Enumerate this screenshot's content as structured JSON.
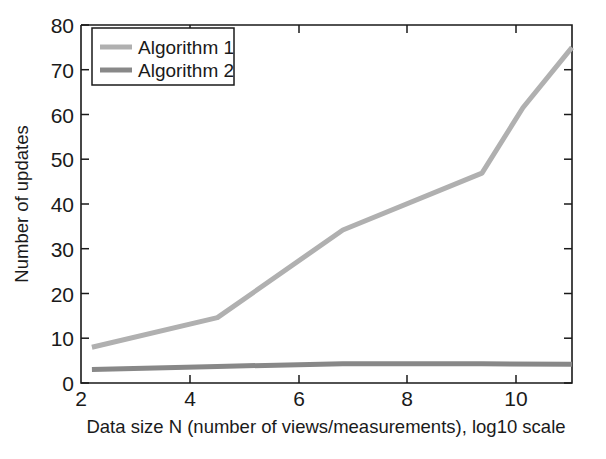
{
  "chart_data": {
    "type": "line",
    "title": "",
    "xlabel": "Data size N (number of views/measurements), log10 scale",
    "ylabel": "Number of updates",
    "xlim": [
      2,
      11
    ],
    "ylim": [
      0,
      80
    ],
    "xticks": [
      2,
      4,
      6,
      8,
      10
    ],
    "xtick_labels": [
      "2",
      "4",
      "6",
      "8",
      "10"
    ],
    "yticks": [
      0,
      10,
      20,
      30,
      40,
      50,
      60,
      70,
      80
    ],
    "ytick_labels": [
      "0",
      "10",
      "20",
      "30",
      "40",
      "50",
      "60",
      "70",
      "80"
    ],
    "grid": false,
    "legend_position": "upper left",
    "series": [
      {
        "name": "Algorithm 1",
        "color": "#b0b0b0",
        "linewidth": 5,
        "x": [
          2.2,
          4.5,
          6.8,
          9.35,
          10.1,
          11.0
        ],
        "y": [
          8.0,
          14.6,
          34.2,
          46.9,
          61.5,
          75.0
        ]
      },
      {
        "name": "Algorithm 2",
        "color": "#888888",
        "linewidth": 5,
        "x": [
          2.2,
          4.5,
          6.8,
          9.35,
          11.0
        ],
        "y": [
          3.0,
          3.7,
          4.3,
          4.3,
          4.2
        ]
      }
    ]
  },
  "axes": {
    "x_axis_title": "Data size N (number of views/measurements), log10 scale",
    "y_axis_title": "Number of updates"
  },
  "legend": {
    "entries": [
      {
        "label": "Algorithm 1"
      },
      {
        "label": "Algorithm 2"
      }
    ]
  },
  "colors": {
    "algorithm_1": "#b0b0b0",
    "algorithm_2": "#888888",
    "axis": "#1a1a1a",
    "background": "#ffffff"
  }
}
